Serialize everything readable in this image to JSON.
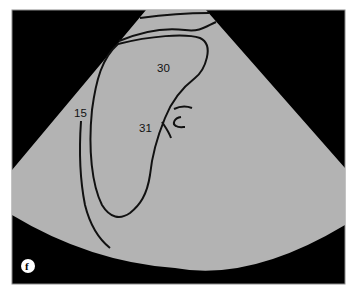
{
  "diagram": {
    "type": "ultrasound-sector-schematic",
    "panel_label": "f",
    "labels": [
      {
        "id": "30",
        "text": "30"
      },
      {
        "id": "31",
        "text": "31"
      },
      {
        "id": "15",
        "text": "15"
      }
    ],
    "colors": {
      "background": "#000000",
      "sector": "#b3b3b3",
      "lines": "#111111",
      "frame_border": "#7a7a7a"
    }
  }
}
